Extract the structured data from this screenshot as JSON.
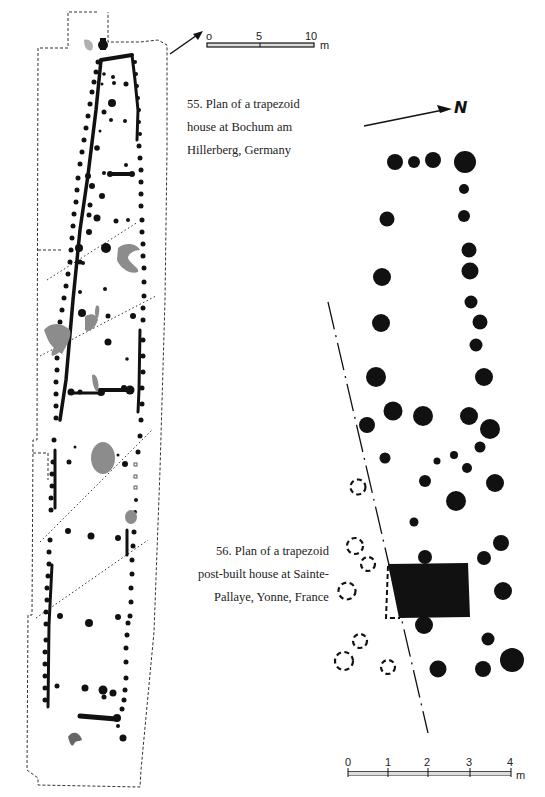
{
  "figures": [
    {
      "id": "55",
      "caption_lines": [
        "55. Plan of a trapezoid",
        "house at Bochum am",
        "Hillerberg, Germany"
      ],
      "scale_bar": {
        "ticks": [
          "o",
          "5",
          "10"
        ],
        "unit": "m"
      },
      "north_arrow": {
        "label": ""
      }
    },
    {
      "id": "56",
      "caption_lines": [
        "56. Plan of a trapezoid",
        "post-built house at Sainte-",
        "Pallaye, Yonne, France"
      ],
      "scale_bar": {
        "ticks": [
          "0",
          "1",
          "2",
          "3",
          "4"
        ],
        "unit": "m"
      },
      "north_arrow": {
        "label": "N"
      }
    }
  ],
  "colors": {
    "ink": "#111111",
    "gray_fill": "#8a8a8a",
    "paper": "#ffffff"
  }
}
